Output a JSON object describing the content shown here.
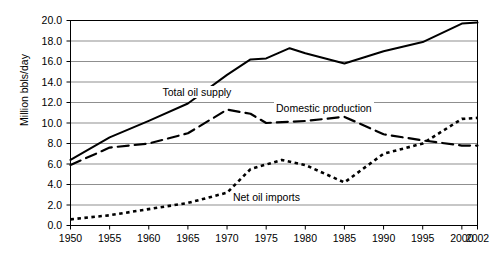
{
  "chart_data": {
    "type": "line",
    "title": "",
    "xlabel": "",
    "ylabel": "Million bbls/day",
    "xlim": [
      1950,
      2002
    ],
    "ylim": [
      0.0,
      20.0
    ],
    "grid": true,
    "legend_position": "inline-annotations",
    "y_ticks": [
      "0.0",
      "2.0",
      "4.0",
      "6.0",
      "8.0",
      "10.0",
      "12.0",
      "14.0",
      "16.0",
      "18.0",
      "20.0"
    ],
    "y_tick_values": [
      0.0,
      2.0,
      4.0,
      6.0,
      8.0,
      10.0,
      12.0,
      14.0,
      16.0,
      18.0,
      20.0
    ],
    "x_ticks": [
      "1950",
      "1955",
      "1960",
      "1965",
      "1970",
      "1975",
      "1980",
      "1985",
      "1990",
      "1995",
      "2000",
      "2002"
    ],
    "x_tick_values": [
      1950,
      1955,
      1960,
      1965,
      1970,
      1975,
      1980,
      1985,
      1990,
      1995,
      2000,
      2002
    ],
    "series": [
      {
        "name": "Total oil supply",
        "style": "solid",
        "color": "#000000",
        "x": [
          1950,
          1955,
          1960,
          1965,
          1970,
          1973,
          1975,
          1978,
          1980,
          1985,
          1990,
          1995,
          2000,
          2002
        ],
        "values": [
          6.4,
          8.6,
          10.2,
          11.9,
          14.7,
          16.2,
          16.3,
          17.3,
          16.8,
          15.8,
          17.0,
          17.9,
          19.7,
          19.8
        ]
      },
      {
        "name": "Domestic production",
        "style": "dashed",
        "color": "#000000",
        "x": [
          1950,
          1955,
          1960,
          1965,
          1970,
          1973,
          1975,
          1980,
          1985,
          1990,
          1995,
          2000,
          2002
        ],
        "values": [
          5.9,
          7.6,
          8.0,
          9.0,
          11.3,
          10.9,
          10.0,
          10.2,
          10.6,
          8.9,
          8.3,
          7.8,
          7.8
        ]
      },
      {
        "name": "Net oil imports",
        "style": "dotted",
        "color": "#000000",
        "x": [
          1950,
          1955,
          1960,
          1965,
          1970,
          1973,
          1977,
          1980,
          1985,
          1990,
          1995,
          2000,
          2002
        ],
        "values": [
          0.6,
          1.0,
          1.6,
          2.2,
          3.2,
          5.5,
          6.4,
          5.9,
          4.2,
          7.0,
          8.0,
          10.4,
          10.5
        ]
      }
    ],
    "annotations": [
      {
        "text": "Total oil supply",
        "series": "Total oil supply"
      },
      {
        "text": "Domestic production",
        "series": "Domestic production"
      },
      {
        "text": "Net oil imports",
        "series": "Net oil imports"
      }
    ]
  }
}
